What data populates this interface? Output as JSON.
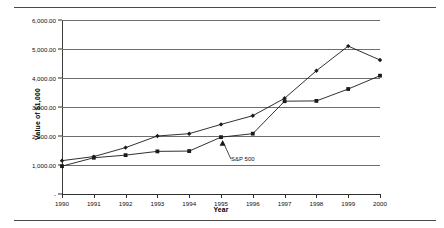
{
  "chart_data": {
    "type": "line",
    "title": "",
    "xlabel": "Year",
    "ylabel": "Value of $1,000",
    "x": [
      1990,
      1991,
      1992,
      1993,
      1994,
      1995,
      1996,
      1997,
      1998,
      1999,
      2000
    ],
    "xtick_labels": [
      "1990",
      "1991",
      "1992",
      "1993",
      "1994",
      "1995",
      "1996",
      "1997",
      "1998",
      "1999",
      "2000"
    ],
    "ytick_labels": [
      "-",
      "1,000.00",
      "2,000.00",
      "3,000.00",
      "4,000.00",
      "5,000.00",
      "6,000.00"
    ],
    "ytick_values": [
      0,
      1000,
      2000,
      3000,
      4000,
      5000,
      6000
    ],
    "ylim": [
      0,
      6000
    ],
    "xlim": [
      1990,
      2000
    ],
    "grid": true,
    "legend": "none",
    "series": [
      {
        "name": "Portfolio",
        "marker": "diamond",
        "color": "#1a1a1a",
        "values": [
          1150,
          1290,
          1600,
          2000,
          2080,
          2400,
          2700,
          3300,
          4250,
          5100,
          4620
        ]
      },
      {
        "name": "S&P 500",
        "marker": "square",
        "color": "#1a1a1a",
        "values": [
          960,
          1250,
          1340,
          1470,
          1480,
          1960,
          2080,
          3200,
          3210,
          3620,
          4080
        ]
      }
    ],
    "annotations": [
      {
        "text": "S&P 500",
        "points_to_year": 1995,
        "points_to_value": 1960
      }
    ]
  },
  "axis": {
    "y_title": "Value of $1,000",
    "x_title": "Year"
  }
}
